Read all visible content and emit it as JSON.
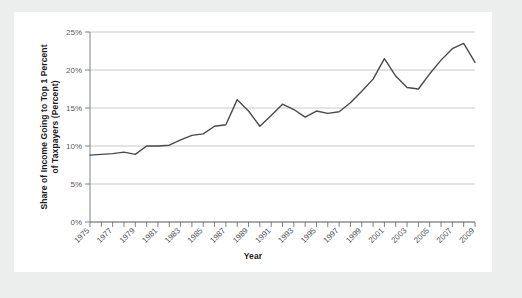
{
  "figure": {
    "background_color": "#eceded",
    "panel_color": "#ffffff"
  },
  "chart_data": {
    "type": "line",
    "title": "",
    "xlabel": "Year",
    "ylabel": "Share of Income Going to Top 1 Percent of Taxpayers (Percent)",
    "ylabel_line1": "Share of Income Going to Top 1 Percent",
    "ylabel_line2": "of Taxpayers (Percent)",
    "xlim": [
      1975,
      2009
    ],
    "ylim": [
      0,
      25
    ],
    "ytick_labels": [
      "0%",
      "5%",
      "10%",
      "15%",
      "20%",
      "25%"
    ],
    "ytick_values": [
      0,
      5,
      10,
      15,
      20,
      25
    ],
    "xtick_labels": [
      "1975",
      "1977",
      "1979",
      "1981",
      "1983",
      "1985",
      "1987",
      "1989",
      "1991",
      "1993",
      "1995",
      "1997",
      "1999",
      "2001",
      "2003",
      "2005",
      "2007",
      "2009"
    ],
    "xtick_values": [
      1975,
      1977,
      1979,
      1981,
      1983,
      1985,
      1987,
      1989,
      1991,
      1993,
      1995,
      1997,
      1999,
      2001,
      2003,
      2005,
      2007,
      2009
    ],
    "minor_xticks": [
      1976,
      1978,
      1980,
      1982,
      1984,
      1986,
      1988,
      1990,
      1992,
      1994,
      1996,
      1998,
      2000,
      2002,
      2004,
      2006,
      2008
    ],
    "grid": "horizontal",
    "legend": "none",
    "line_color": "#4a4a4a",
    "x": [
      1975,
      1976,
      1977,
      1978,
      1979,
      1980,
      1981,
      1982,
      1983,
      1984,
      1985,
      1986,
      1987,
      1988,
      1989,
      1990,
      1991,
      1992,
      1993,
      1994,
      1995,
      1996,
      1997,
      1998,
      1999,
      2000,
      2001,
      2002,
      2003,
      2004,
      2005,
      2006,
      2007,
      2008,
      2009
    ],
    "values": [
      8.8,
      8.9,
      9.0,
      9.2,
      8.9,
      10.0,
      10.0,
      10.1,
      10.8,
      11.4,
      11.6,
      12.6,
      12.8,
      16.1,
      14.6,
      12.6,
      14.0,
      15.5,
      14.8,
      13.8,
      14.6,
      14.3,
      14.5,
      15.7,
      17.2,
      18.8,
      21.5,
      19.2,
      17.7,
      17.5,
      19.5,
      21.3,
      22.8,
      23.5,
      21.0
    ],
    "source_note": ""
  }
}
